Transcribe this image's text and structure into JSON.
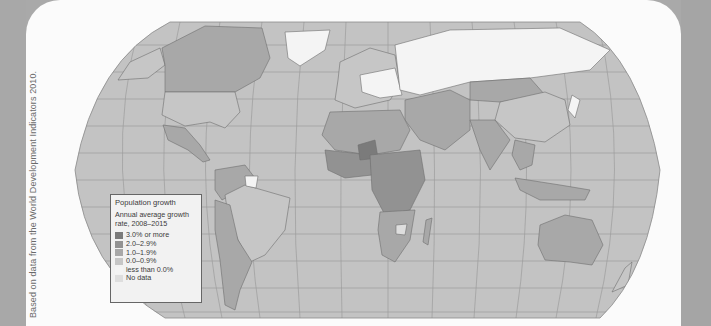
{
  "source_credit": "Based on data from the World Development Indicators 2010.",
  "legend": {
    "title": "Population growth",
    "subtitle": "Annual average growth rate, 2008–2015",
    "items": [
      {
        "label": "3.0% or more",
        "color": "#7b7b7b"
      },
      {
        "label": "2.0–2.9%",
        "color": "#929292"
      },
      {
        "label": "1.0–1.9%",
        "color": "#a8a8a8"
      },
      {
        "label": "0.0–0.9%",
        "color": "#c6c6c6"
      },
      {
        "label": "less than 0.0%",
        "color": "#f4f4f4"
      },
      {
        "label": "No data",
        "color": "#dedede"
      }
    ]
  },
  "colors": {
    "ocean": "#c2c2c2",
    "graticule": "#9a9a9a",
    "panel": "#fbfbfb",
    "margin": "#a9a9a9"
  }
}
